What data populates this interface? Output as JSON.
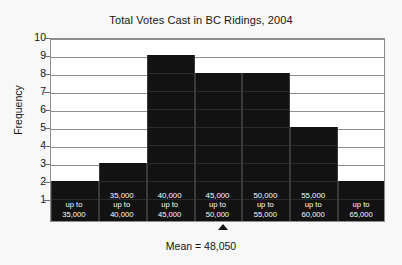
{
  "chart_data": {
    "type": "bar",
    "title": "Total Votes Cast in BC Ridings, 2004",
    "xlabel": "",
    "ylabel": "Frequency",
    "categories": [
      "30,000 up to 35,000",
      "35,000 up to 40,000",
      "40,000 up to 45,000",
      "45,000 up to 50,000",
      "50,000 up to 55,000",
      "55,000 up to 60,000",
      "60,000 up to 65,000"
    ],
    "bin_labels": [
      {
        "top": "30,000",
        "mid": "up to",
        "bot": "35,000"
      },
      {
        "top": "35,000",
        "mid": "up to",
        "bot": "40,000"
      },
      {
        "top": "40,000",
        "mid": "up to",
        "bot": "45,000"
      },
      {
        "top": "45,000",
        "mid": "up to",
        "bot": "50,000"
      },
      {
        "top": "50,000",
        "mid": "up to",
        "bot": "55,000"
      },
      {
        "top": "55,000",
        "mid": "up to",
        "bot": "60,000"
      },
      {
        "top": "60,000",
        "mid": "up to",
        "bot": "65,000"
      }
    ],
    "values": [
      2,
      3,
      9,
      8,
      8,
      5,
      2
    ],
    "ylim": [
      0,
      10
    ],
    "yticks": [
      10,
      9,
      8,
      7,
      6,
      5,
      4,
      3,
      2,
      1
    ],
    "grid": true,
    "legend": "none",
    "bar_color": "#121212",
    "grid_color": "#8d8d8d",
    "plot_background": "#ffffff",
    "annotations": [
      {
        "name": "mean-marker",
        "label": "Mean = 48,050",
        "value": 48050,
        "marker": "triangle-up"
      }
    ]
  }
}
